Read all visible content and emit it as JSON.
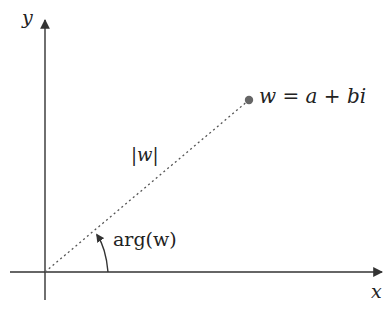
{
  "diagram": {
    "type": "complex-plane",
    "colors": {
      "axis": "#333333",
      "dashed": "#555555",
      "point": "#666666",
      "text": "#222222"
    },
    "axes": {
      "x_label": "x",
      "y_label": "y"
    },
    "point": {
      "label": "w = a + bi"
    },
    "modulus_label": "|w|",
    "angle_label": "arg(w)"
  }
}
